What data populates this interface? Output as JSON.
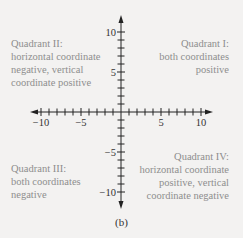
{
  "figure": {
    "caption": "(b)",
    "axes": {
      "x_range": [
        -10,
        10
      ],
      "y_range": [
        -10,
        10
      ],
      "minor_tick_step": 1,
      "x_tick_labels": [
        "−10",
        "−5",
        "5",
        "10"
      ],
      "y_tick_labels": [
        "10",
        "5",
        "−5",
        "−10"
      ]
    },
    "quadrants": {
      "q1": {
        "lines": [
          "Quadrant I:",
          "both coordinates",
          "positive"
        ]
      },
      "q2": {
        "lines": [
          "Quadrant II:",
          "horizontal coordinate",
          "negative, vertical",
          "coordinate positive"
        ]
      },
      "q3": {
        "lines": [
          "Quadrant III:",
          "both coordinates",
          "negative"
        ]
      },
      "q4": {
        "lines": [
          "Quadrant IV:",
          "horizontal coordinate",
          "positive, vertical",
          "coordinate negative"
        ]
      }
    },
    "colors": {
      "background": "#f3f2f1",
      "axis": "#222222",
      "label_text": "#8e8e8e",
      "tick_text": "#333333"
    }
  }
}
